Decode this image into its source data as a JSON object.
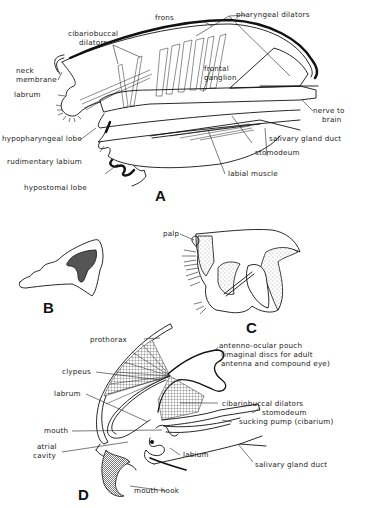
{
  "figure": {
    "panels": [
      {
        "id": "A",
        "letter": "A",
        "labels": {
          "frons": "frons",
          "pharyngeal_dilators": "pharyngeal dilators",
          "cibariobuccal_dilators_1": "cibariobuccal",
          "cibariobuccal_dilators_2": "dilators",
          "neck_membrane_1": "neck",
          "neck_membrane_2": "membrane",
          "labrum": "labrum",
          "frontal_ganglion_1": "frontal",
          "frontal_ganglion_2": "ganglion",
          "nerve_to_brain_1": "nerve to",
          "nerve_to_brain_2": "brain",
          "hypopharyngeal_lobe": "hypopharyngeal lobe",
          "salivary_gland_duct": "salivary gland duct",
          "rudimentary_labium": "rudimentary labium",
          "stomodeum": "stomodeum",
          "labial_muscle": "labial muscle",
          "hypostomal_lobe": "hypostomal lobe"
        }
      },
      {
        "id": "B",
        "letter": "B",
        "labels": {}
      },
      {
        "id": "C",
        "letter": "C",
        "labels": {
          "palp": "palp"
        }
      },
      {
        "id": "D",
        "letter": "D",
        "labels": {
          "prothorax": "prothorax",
          "antenno_ocular_pouch_1": "antenno-ocular pouch",
          "antenno_ocular_pouch_2": "(imaginal discs for adult",
          "antenno_ocular_pouch_3": "antenna and compound eye)",
          "clypeus": "clypeus",
          "labrum": "labrum",
          "cibariobuccal_dilators": "cibariobuccal dilators",
          "stomodeum": "stomodeum",
          "mouth": "mouth",
          "sucking_pump": "sucking pump (cibarium)",
          "atrial_cavity_1": "atrial",
          "atrial_cavity_2": "cavity",
          "labium": "labium",
          "salivary_gland_duct": "salivary gland duct",
          "mouth_hook": "mouth hook"
        }
      }
    ]
  }
}
